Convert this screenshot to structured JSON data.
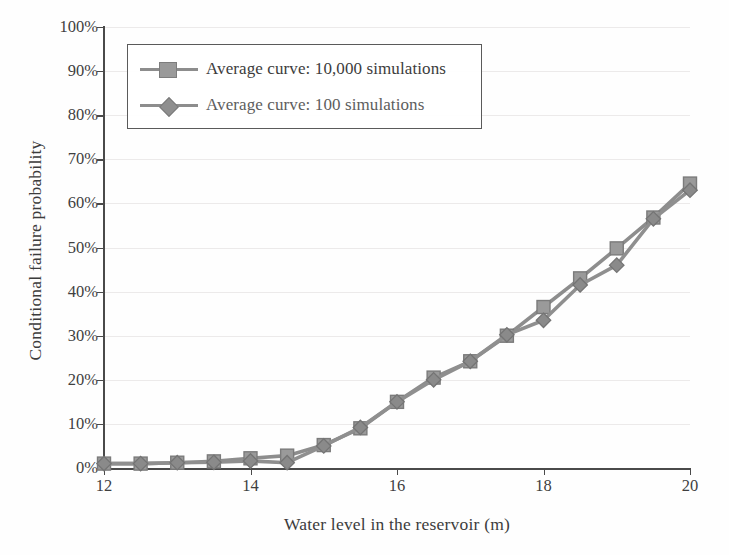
{
  "chart_data": {
    "type": "line",
    "title": "",
    "xlabel": "Water level in the reservoir (m)",
    "ylabel": "Conditional failure probability",
    "xlim": [
      12,
      20
    ],
    "ylim": [
      0,
      100
    ],
    "xticks": [
      "12",
      "14",
      "16",
      "18",
      "20"
    ],
    "xtick_values": [
      12,
      14,
      16,
      18,
      20
    ],
    "yticks": [
      "0%",
      "10%",
      "20%",
      "30%",
      "40%",
      "50%",
      "60%",
      "70%",
      "80%",
      "90%",
      "100%"
    ],
    "ytick_values": [
      0,
      10,
      20,
      30,
      40,
      50,
      60,
      70,
      80,
      90,
      100
    ],
    "grid": "horizontal",
    "legend_position": "upper-left",
    "y_unit": "percent",
    "x": [
      12,
      12.5,
      13,
      13.5,
      14,
      14.5,
      15,
      15.5,
      16,
      16.5,
      17,
      17.5,
      18,
      18.5,
      19,
      19.5,
      20
    ],
    "series": [
      {
        "name": "Average curve: 10,000 simulations",
        "marker": "square",
        "color": "#8d8d8d",
        "values": [
          1,
          1,
          1.2,
          1.5,
          2.2,
          2.8,
          5.2,
          9,
          15,
          20.5,
          24.2,
          30,
          36.5,
          43,
          49.8,
          56.8,
          64.5
        ]
      },
      {
        "name": "Average curve: 100 simulations",
        "marker": "diamond",
        "color": "#8f8f8f",
        "values": [
          1,
          1,
          1.2,
          1.3,
          1.6,
          1.2,
          5,
          9.2,
          15,
          20,
          24.2,
          30.2,
          33.5,
          41.5,
          46,
          56.5,
          63
        ]
      }
    ]
  },
  "legend": {
    "items": [
      {
        "label": "Average curve: 10,000 simulations",
        "marker": "square"
      },
      {
        "label": "Average curve: 100 simulations",
        "marker": "diamond"
      }
    ]
  },
  "colors": {
    "series_1": "#8d8d8d",
    "series_2": "#8f8f8f",
    "axis": "#4a4a4a",
    "grid": "#eceaea",
    "text": "#3c3c3c",
    "background": "#fefefe"
  }
}
